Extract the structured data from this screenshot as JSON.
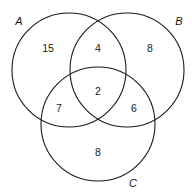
{
  "diagram": {
    "type": "venn-3",
    "sets": [
      {
        "id": "A",
        "label": "A"
      },
      {
        "id": "B",
        "label": "B"
      },
      {
        "id": "C",
        "label": "C"
      }
    ],
    "regions": [
      {
        "sets": [
          "A"
        ],
        "label": "15"
      },
      {
        "sets": [
          "A",
          "B"
        ],
        "label": "4"
      },
      {
        "sets": [
          "B"
        ],
        "label": "8"
      },
      {
        "sets": [
          "A",
          "B",
          "C"
        ],
        "label": "2"
      },
      {
        "sets": [
          "A",
          "C"
        ],
        "label": "7"
      },
      {
        "sets": [
          "B",
          "C"
        ],
        "label": "6"
      },
      {
        "sets": [
          "C"
        ],
        "label": "8"
      }
    ]
  }
}
